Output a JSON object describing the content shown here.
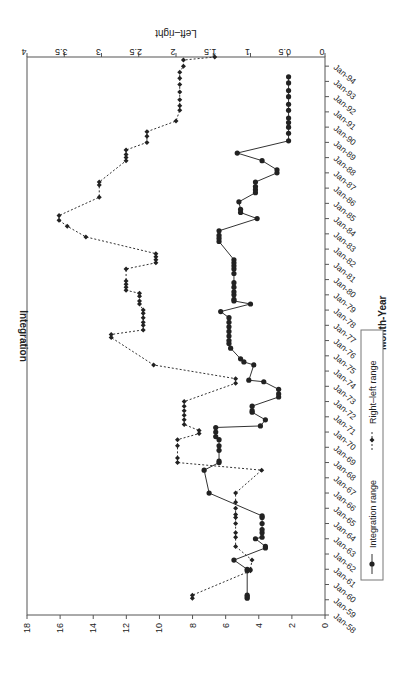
{
  "chart_data": {
    "type": "line",
    "orientation": "rotated-90-clockwise",
    "xlabel": "Month-Year",
    "ylabel": "Integration",
    "y2label": "Left–right",
    "ylim": [
      0,
      18
    ],
    "y2lim": [
      0,
      4
    ],
    "y_ticks": [
      0,
      2,
      4,
      6,
      8,
      10,
      12,
      14,
      16,
      18
    ],
    "y2_ticks": [
      0,
      0.5,
      1,
      1.5,
      2,
      2.5,
      3,
      3.5,
      4
    ],
    "x_ticks": [
      "Jan-58",
      "Jan-59",
      "Jan-60",
      "Jan-61",
      "Jan-62",
      "Jan-63",
      "Jan-64",
      "Jan-65",
      "Jan-66",
      "Jan-67",
      "Jan-68",
      "Jan-69",
      "Jan-70",
      "Jan-71",
      "Jan-72",
      "Jan-73",
      "Jan-74",
      "Jan-75",
      "Jan-76",
      "Jan-77",
      "Jan-78",
      "Jan-79",
      "Jan-80",
      "Jan-81",
      "Jan-82",
      "Jan-83",
      "Jan-84",
      "Jan-85",
      "Jan-86",
      "Jan-87",
      "Jan-88",
      "Jan-89",
      "Jan-90",
      "Jan-91",
      "Jan-92",
      "Jan-93",
      "Jan-94"
    ],
    "grid": false,
    "legend": {
      "position": "bottom",
      "entries": [
        "Integration range",
        "Right–left range"
      ]
    },
    "series": [
      {
        "name": "Integration range",
        "axis": "left",
        "style": "solid-circle",
        "points": [
          [
            1959.1,
            4.7
          ],
          [
            1959.2,
            4.7
          ],
          [
            1959.3,
            4.7
          ],
          [
            1960.9,
            4.7
          ],
          [
            1961.0,
            4.7
          ],
          [
            1961.6,
            5.5
          ],
          [
            1962.4,
            3.6
          ],
          [
            1962.5,
            3.6
          ],
          [
            1963.0,
            4.2
          ],
          [
            1963.1,
            3.8
          ],
          [
            1963.4,
            3.8
          ],
          [
            1963.6,
            3.8
          ],
          [
            1964.0,
            3.8
          ],
          [
            1964.4,
            3.8
          ],
          [
            1964.5,
            3.8
          ],
          [
            1966.0,
            7.0
          ],
          [
            1967.5,
            7.3
          ],
          [
            1968.0,
            6.4
          ],
          [
            1968.1,
            6.4
          ],
          [
            1968.8,
            6.4
          ],
          [
            1969.1,
            6.4
          ],
          [
            1969.5,
            6.4
          ],
          [
            1969.7,
            6.6
          ],
          [
            1970.0,
            6.6
          ],
          [
            1970.3,
            6.6
          ],
          [
            1970.4,
            3.9
          ],
          [
            1970.8,
            3.6
          ],
          [
            1971.3,
            4.4
          ],
          [
            1971.4,
            4.4
          ],
          [
            1971.7,
            4.4
          ],
          [
            1972.3,
            2.8
          ],
          [
            1972.5,
            2.8
          ],
          [
            1972.8,
            2.8
          ],
          [
            1973.3,
            3.7
          ],
          [
            1973.4,
            4.6
          ],
          [
            1974.4,
            4.3
          ],
          [
            1974.6,
            4.9
          ],
          [
            1974.8,
            5.1
          ],
          [
            1975.5,
            5.7
          ],
          [
            1975.8,
            5.8
          ],
          [
            1976.0,
            5.8
          ],
          [
            1976.3,
            5.8
          ],
          [
            1976.6,
            5.8
          ],
          [
            1976.9,
            5.8
          ],
          [
            1977.2,
            5.8
          ],
          [
            1977.5,
            5.8
          ],
          [
            1977.9,
            6.3
          ],
          [
            1978.4,
            4.5
          ],
          [
            1978.6,
            5.5
          ],
          [
            1978.7,
            5.5
          ],
          [
            1979.0,
            5.5
          ],
          [
            1979.2,
            5.5
          ],
          [
            1979.5,
            5.5
          ],
          [
            1979.8,
            5.5
          ],
          [
            1980.4,
            5.5
          ],
          [
            1980.7,
            5.5
          ],
          [
            1980.9,
            5.5
          ],
          [
            1981.1,
            5.5
          ],
          [
            1981.3,
            5.5
          ],
          [
            1982.5,
            6.4
          ],
          [
            1982.7,
            6.4
          ],
          [
            1982.9,
            6.4
          ],
          [
            1983.2,
            6.4
          ],
          [
            1984.0,
            4.1
          ],
          [
            1984.4,
            5.1
          ],
          [
            1984.6,
            5.1
          ],
          [
            1985.1,
            5.2
          ],
          [
            1985.7,
            4.2
          ],
          [
            1985.9,
            4.2
          ],
          [
            1986.1,
            4.2
          ],
          [
            1986.4,
            4.2
          ],
          [
            1987.0,
            2.9
          ],
          [
            1987.2,
            2.9
          ],
          [
            1987.8,
            3.8
          ],
          [
            1988.3,
            5.3
          ],
          [
            1989.1,
            2.2
          ],
          [
            1989.6,
            2.2
          ],
          [
            1990.0,
            2.2
          ],
          [
            1990.3,
            2.2
          ],
          [
            1990.6,
            2.2
          ],
          [
            1991.1,
            2.2
          ],
          [
            1991.5,
            2.2
          ],
          [
            1992.0,
            2.2
          ],
          [
            1992.4,
            2.2
          ],
          [
            1992.9,
            2.2
          ],
          [
            1993.3,
            2.2
          ]
        ]
      },
      {
        "name": "Right–left range",
        "axis": "right",
        "style": "dotted-diamond",
        "points": [
          [
            1959.1,
            1.78
          ],
          [
            1959.3,
            1.78
          ],
          [
            1960.9,
            1.0
          ],
          [
            1961.0,
            1.0
          ],
          [
            1961.6,
            0.98
          ],
          [
            1962.5,
            1.2
          ],
          [
            1963.1,
            1.2
          ],
          [
            1963.4,
            1.2
          ],
          [
            1964.0,
            1.2
          ],
          [
            1964.4,
            1.2
          ],
          [
            1964.6,
            1.2
          ],
          [
            1965.0,
            1.2
          ],
          [
            1965.4,
            1.2
          ],
          [
            1966.0,
            1.2
          ],
          [
            1967.5,
            0.85
          ],
          [
            1968.0,
            1.98
          ],
          [
            1968.3,
            1.98
          ],
          [
            1969.1,
            1.98
          ],
          [
            1969.5,
            1.98
          ],
          [
            1969.9,
            1.69
          ],
          [
            1970.1,
            1.69
          ],
          [
            1970.5,
            1.89
          ],
          [
            1970.8,
            1.89
          ],
          [
            1971.1,
            1.89
          ],
          [
            1971.4,
            1.89
          ],
          [
            1971.7,
            1.89
          ],
          [
            1972.0,
            1.89
          ],
          [
            1973.2,
            1.2
          ],
          [
            1973.5,
            1.2
          ],
          [
            1974.4,
            2.3
          ],
          [
            1976.2,
            2.87
          ],
          [
            1976.4,
            2.87
          ],
          [
            1976.7,
            2.44
          ],
          [
            1977.0,
            2.44
          ],
          [
            1977.2,
            2.44
          ],
          [
            1977.5,
            2.44
          ],
          [
            1977.8,
            2.44
          ],
          [
            1978.0,
            2.44
          ],
          [
            1978.4,
            2.49
          ],
          [
            1978.6,
            2.49
          ],
          [
            1978.9,
            2.49
          ],
          [
            1979.1,
            2.49
          ],
          [
            1979.3,
            2.67
          ],
          [
            1979.5,
            2.67
          ],
          [
            1979.7,
            2.67
          ],
          [
            1979.9,
            2.67
          ],
          [
            1980.7,
            2.67
          ],
          [
            1981.1,
            2.27
          ],
          [
            1981.3,
            2.27
          ],
          [
            1981.5,
            2.27
          ],
          [
            1981.7,
            2.27
          ],
          [
            1982.8,
            3.21
          ],
          [
            1983.5,
            3.46
          ],
          [
            1983.9,
            3.57
          ],
          [
            1984.2,
            3.57
          ],
          [
            1985.4,
            3.03
          ],
          [
            1986.2,
            3.03
          ],
          [
            1986.4,
            3.03
          ],
          [
            1987.8,
            2.67
          ],
          [
            1988.0,
            2.67
          ],
          [
            1988.2,
            2.67
          ],
          [
            1988.5,
            2.67
          ],
          [
            1989.0,
            2.39
          ],
          [
            1989.4,
            2.39
          ],
          [
            1989.7,
            2.39
          ],
          [
            1990.4,
            2.0
          ],
          [
            1991.1,
            1.95
          ],
          [
            1991.4,
            1.95
          ],
          [
            1991.8,
            1.95
          ],
          [
            1992.3,
            1.95
          ],
          [
            1992.8,
            1.95
          ],
          [
            1993.2,
            1.95
          ],
          [
            1993.6,
            1.95
          ],
          [
            1994.0,
            1.9
          ],
          [
            1994.4,
            1.9
          ],
          [
            1994.6,
            1.48
          ]
        ]
      }
    ],
    "annotations": []
  }
}
